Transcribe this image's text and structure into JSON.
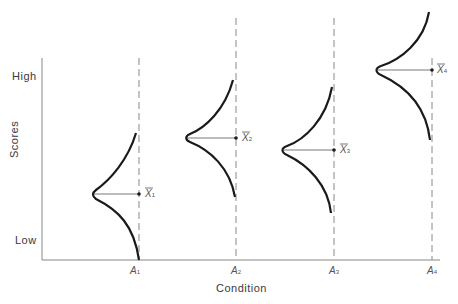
{
  "diagram": {
    "type": "distribution-by-condition",
    "y_axis": {
      "label": "Scores",
      "tick_high": "High",
      "tick_low": "Low"
    },
    "x_axis": {
      "label": "Condition",
      "ticks": [
        {
          "base": "A",
          "sub": "1"
        },
        {
          "base": "A",
          "sub": "2"
        },
        {
          "base": "A",
          "sub": "3"
        },
        {
          "base": "A",
          "sub": "4"
        }
      ]
    },
    "means": [
      {
        "base": "X",
        "sub": "1"
      },
      {
        "base": "X",
        "sub": "2"
      },
      {
        "base": "X",
        "sub": "3"
      },
      {
        "base": "X",
        "sub": "4"
      }
    ],
    "colors": {
      "curve": "#1a1a1a",
      "axis": "#777777",
      "dashed": "#888888",
      "text": "#3a3a3a"
    }
  }
}
